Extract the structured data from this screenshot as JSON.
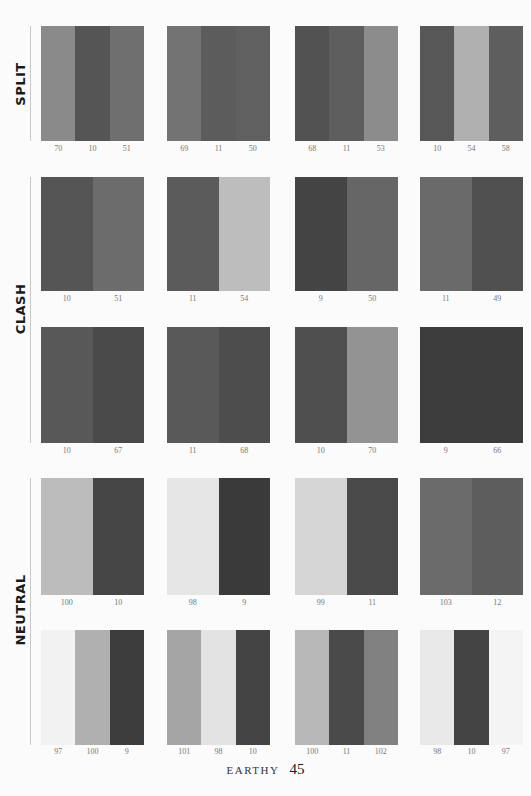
{
  "sections": [
    {
      "label": "SPLIT"
    },
    {
      "label": "CLASH"
    },
    {
      "label": "NEUTRAL"
    }
  ],
  "rows": [
    {
      "section": "SPLIT",
      "top": 26,
      "height": 115,
      "label_top": 144,
      "swatches": [
        {
          "colors": [
            "#8a8a8a",
            "#555555",
            "#6f6f6f"
          ],
          "numbers": [
            "70",
            "10",
            "51"
          ]
        },
        {
          "colors": [
            "#737373",
            "#5c5c5c",
            "#606060"
          ],
          "numbers": [
            "69",
            "11",
            "50"
          ]
        },
        {
          "colors": [
            "#525252",
            "#5e5e5e",
            "#8c8c8c"
          ],
          "numbers": [
            "68",
            "11",
            "53"
          ]
        },
        {
          "colors": [
            "#575757",
            "#b0b0b0",
            "#5e5e5e"
          ],
          "numbers": [
            "10",
            "54",
            "58"
          ]
        }
      ]
    },
    {
      "section": "CLASH",
      "top": 177,
      "height": 114,
      "label_top": 294,
      "swatches": [
        {
          "colors": [
            "#555555",
            "#6c6c6c"
          ],
          "numbers": [
            "10",
            "51"
          ]
        },
        {
          "colors": [
            "#5b5b5b",
            "#bdbdbd"
          ],
          "numbers": [
            "11",
            "54"
          ]
        },
        {
          "colors": [
            "#444444",
            "#666666"
          ],
          "numbers": [
            "9",
            "50"
          ]
        },
        {
          "colors": [
            "#6a6a6a",
            "#505050"
          ],
          "numbers": [
            "11",
            "49"
          ]
        }
      ]
    },
    {
      "section": "CLASH",
      "top": 327,
      "height": 116,
      "label_top": 446,
      "swatches": [
        {
          "colors": [
            "#585858",
            "#4a4a4a"
          ],
          "numbers": [
            "10",
            "67"
          ]
        },
        {
          "colors": [
            "#595959",
            "#4d4d4d"
          ],
          "numbers": [
            "11",
            "68"
          ]
        },
        {
          "colors": [
            "#4f4f4f",
            "#939393"
          ],
          "numbers": [
            "10",
            "70"
          ]
        },
        {
          "colors": [
            "#3c3c3c",
            "#3c3c3c"
          ],
          "numbers": [
            "9",
            "66"
          ]
        }
      ]
    },
    {
      "section": "NEUTRAL",
      "top": 478,
      "height": 117,
      "label_top": 598,
      "swatches": [
        {
          "colors": [
            "#bcbcbc",
            "#464646"
          ],
          "numbers": [
            "100",
            "10"
          ]
        },
        {
          "colors": [
            "#e6e6e6",
            "#3a3a3a"
          ],
          "numbers": [
            "98",
            "9"
          ]
        },
        {
          "colors": [
            "#d5d5d5",
            "#4a4a4a"
          ],
          "numbers": [
            "99",
            "11"
          ]
        },
        {
          "colors": [
            "#6b6b6b",
            "#5d5d5d"
          ],
          "numbers": [
            "103",
            "12"
          ]
        }
      ]
    },
    {
      "section": "NEUTRAL",
      "top": 630,
      "height": 115,
      "label_top": 747,
      "swatches": [
        {
          "colors": [
            "#f2f2f2",
            "#b0b0b0",
            "#3d3d3d"
          ],
          "numbers": [
            "97",
            "100",
            "9"
          ]
        },
        {
          "colors": [
            "#a5a5a5",
            "#e3e3e3",
            "#444444"
          ],
          "numbers": [
            "101",
            "98",
            "10"
          ]
        },
        {
          "colors": [
            "#b8b8b8",
            "#4a4a4a",
            "#818181"
          ],
          "numbers": [
            "100",
            "11",
            "102"
          ]
        },
        {
          "colors": [
            "#e9e9e9",
            "#444444",
            "#f4f4f4"
          ],
          "numbers": [
            "98",
            "10",
            "97"
          ]
        }
      ]
    }
  ],
  "footer": {
    "title": "EARTHY",
    "page_number": "45"
  }
}
